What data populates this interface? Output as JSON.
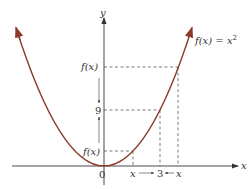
{
  "diagram": {
    "function_label": "f(x) = x",
    "function_exponent": "2",
    "y_axis_label": "y",
    "x_axis_label": "x",
    "origin_label": "0",
    "y_ticks": [
      {
        "label": "f(x)",
        "position": "upper"
      },
      {
        "label": "9",
        "position": "middle"
      },
      {
        "label": "f(x)",
        "position": "lower"
      }
    ],
    "x_ticks": [
      {
        "label": "x",
        "position": "left"
      },
      {
        "label": "3",
        "position": "middle"
      },
      {
        "label": "x",
        "position": "right"
      }
    ],
    "colors": {
      "curve": "#8b3a2a",
      "axes": "#333333",
      "dashes": "#444444"
    }
  }
}
